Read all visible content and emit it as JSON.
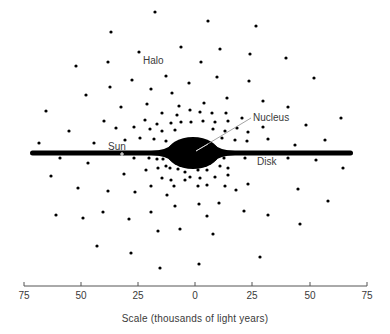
{
  "diagram": {
    "labels": {
      "halo": "Halo",
      "nucleus": "Nucleus",
      "sun": "Sun",
      "disk": "Disk"
    },
    "label_positions": {
      "halo": [
        143,
        56
      ],
      "nucleus": [
        253,
        113
      ],
      "sun": [
        108,
        142
      ],
      "disk": [
        257,
        157
      ]
    },
    "colors": {
      "ink": "#000000",
      "text": "#3a3a3a",
      "background": "#ffffff",
      "sun_marker": "#ffffff"
    },
    "disk": {
      "x_start": 30,
      "x_end": 353,
      "y": 153,
      "thickness": 5
    },
    "nucleus_shape": {
      "cx": 193,
      "cy": 153,
      "rx": 26,
      "ry": 16
    },
    "nucleus_leader": {
      "from": [
        196,
        151
      ],
      "to": [
        251,
        118
      ]
    },
    "sun_marker": {
      "x": 122,
      "y": 154
    },
    "halo_stars": [
      [
        155,
        12
      ],
      [
        208,
        21
      ],
      [
        256,
        26
      ],
      [
        111,
        32
      ],
      [
        181,
        47
      ],
      [
        220,
        49
      ],
      [
        139,
        52
      ],
      [
        250,
        54
      ],
      [
        286,
        58
      ],
      [
        201,
        62
      ],
      [
        76,
        66
      ],
      [
        108,
        62
      ],
      [
        166,
        76
      ],
      [
        217,
        77
      ],
      [
        132,
        80
      ],
      [
        249,
        81
      ],
      [
        314,
        78
      ],
      [
        110,
        87
      ],
      [
        151,
        89
      ],
      [
        189,
        83
      ],
      [
        86,
        95
      ],
      [
        172,
        93
      ],
      [
        204,
        103
      ],
      [
        227,
        98
      ],
      [
        263,
        101
      ],
      [
        121,
        107
      ],
      [
        147,
        104
      ],
      [
        179,
        106
      ],
      [
        288,
        107
      ],
      [
        46,
        111
      ],
      [
        162,
        113
      ],
      [
        177,
        115
      ],
      [
        190,
        110
      ],
      [
        200,
        112
      ],
      [
        212,
        113
      ],
      [
        226,
        113
      ],
      [
        242,
        118
      ],
      [
        341,
        118
      ],
      [
        104,
        121
      ],
      [
        145,
        120
      ],
      [
        157,
        124
      ],
      [
        171,
        123
      ],
      [
        181,
        122
      ],
      [
        191,
        122
      ],
      [
        203,
        121
      ],
      [
        215,
        122
      ],
      [
        228,
        121
      ],
      [
        306,
        125
      ],
      [
        69,
        131
      ],
      [
        116,
        128
      ],
      [
        134,
        127
      ],
      [
        150,
        129
      ],
      [
        162,
        131
      ],
      [
        175,
        130
      ],
      [
        213,
        129
      ],
      [
        225,
        131
      ],
      [
        237,
        128
      ],
      [
        248,
        132
      ],
      [
        263,
        127
      ],
      [
        325,
        140
      ],
      [
        39,
        143
      ],
      [
        94,
        143
      ],
      [
        125,
        140
      ],
      [
        140,
        138
      ],
      [
        154,
        139
      ],
      [
        166,
        141
      ],
      [
        222,
        138
      ],
      [
        235,
        140
      ],
      [
        247,
        141
      ],
      [
        268,
        139
      ],
      [
        295,
        145
      ],
      [
        60,
        158
      ],
      [
        88,
        163
      ],
      [
        134,
        158
      ],
      [
        149,
        158
      ],
      [
        157,
        159
      ],
      [
        163,
        159
      ],
      [
        205,
        161
      ],
      [
        215,
        159
      ],
      [
        224,
        158
      ],
      [
        245,
        158
      ],
      [
        288,
        158
      ],
      [
        316,
        160
      ],
      [
        343,
        168
      ],
      [
        146,
        170
      ],
      [
        158,
        168
      ],
      [
        166,
        166
      ],
      [
        170,
        168
      ],
      [
        178,
        169
      ],
      [
        198,
        170
      ],
      [
        207,
        170
      ],
      [
        220,
        166
      ],
      [
        228,
        168
      ],
      [
        51,
        176
      ],
      [
        124,
        174
      ],
      [
        162,
        178
      ],
      [
        171,
        180
      ],
      [
        185,
        172
      ],
      [
        185,
        180
      ],
      [
        190,
        177
      ],
      [
        200,
        178
      ],
      [
        215,
        177
      ],
      [
        228,
        175
      ],
      [
        78,
        188
      ],
      [
        108,
        191
      ],
      [
        135,
        192
      ],
      [
        151,
        186
      ],
      [
        174,
        186
      ],
      [
        198,
        186
      ],
      [
        207,
        185
      ],
      [
        225,
        186
      ],
      [
        236,
        190
      ],
      [
        248,
        184
      ],
      [
        298,
        189
      ],
      [
        167,
        195
      ],
      [
        175,
        206
      ],
      [
        199,
        204
      ],
      [
        219,
        203
      ],
      [
        328,
        201
      ],
      [
        56,
        215
      ],
      [
        83,
        218
      ],
      [
        103,
        212
      ],
      [
        129,
        219
      ],
      [
        151,
        212
      ],
      [
        207,
        216
      ],
      [
        244,
        211
      ],
      [
        268,
        215
      ],
      [
        300,
        224
      ],
      [
        158,
        231
      ],
      [
        180,
        229
      ],
      [
        213,
        234
      ],
      [
        97,
        246
      ],
      [
        131,
        253
      ],
      [
        260,
        257
      ],
      [
        160,
        268
      ],
      [
        199,
        264
      ]
    ]
  },
  "scale": {
    "title": "Scale (thousands of light years)",
    "axis": {
      "x_start": 24,
      "x_end": 367,
      "y": 286
    },
    "ticks": [
      {
        "label": "75",
        "x": 24
      },
      {
        "label": "50",
        "x": 81
      },
      {
        "label": "25",
        "x": 138
      },
      {
        "label": "0",
        "x": 195
      },
      {
        "label": "25",
        "x": 252
      },
      {
        "label": "50",
        "x": 310
      },
      {
        "label": "75",
        "x": 367
      }
    ]
  }
}
